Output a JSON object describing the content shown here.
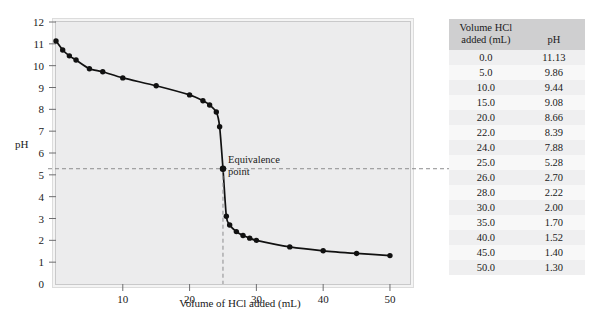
{
  "chart_data": {
    "type": "line",
    "title": "",
    "xlabel": "Volume of HCl added (mL)",
    "ylabel": "pH",
    "xlim": [
      0,
      53
    ],
    "ylim": [
      0,
      12
    ],
    "xticks": [
      10,
      20,
      30,
      40,
      50
    ],
    "yticks": [
      0,
      1,
      2,
      3,
      4,
      5,
      6,
      7,
      8,
      9,
      10,
      11,
      12
    ],
    "grid": false,
    "legend": null,
    "x": [
      0.0,
      1.0,
      2.0,
      3.0,
      5.0,
      7.0,
      10.0,
      15.0,
      20.0,
      22.0,
      23.0,
      24.0,
      24.5,
      25.0,
      25.5,
      26.0,
      27.0,
      28.0,
      29.0,
      30.0,
      35.0,
      40.0,
      45.0,
      50.0
    ],
    "y": [
      11.13,
      10.72,
      10.45,
      10.26,
      9.86,
      9.72,
      9.44,
      9.08,
      8.66,
      8.39,
      8.2,
      7.88,
      7.2,
      5.28,
      3.1,
      2.7,
      2.4,
      2.22,
      2.1,
      2.0,
      1.7,
      1.52,
      1.4,
      1.3
    ],
    "annotations": [
      {
        "label_line1": "Equivalence",
        "label_line2": "point",
        "x": 25.0,
        "y": 5.28
      }
    ]
  },
  "chart": {
    "ylabel": "pH",
    "xlabel": "Volume of HCl added (mL)",
    "ytick_labels": [
      "12",
      "11",
      "10",
      "9",
      "8",
      "7",
      "6",
      "5",
      "4",
      "3",
      "2",
      "1",
      "0"
    ],
    "xtick_labels": [
      "10",
      "20",
      "30",
      "40",
      "50"
    ],
    "equivalence_label_line1": "Equivalence",
    "equivalence_label_line2": "point"
  },
  "table": {
    "headers": {
      "volume_line1": "Volume HCl",
      "volume_line2": "added (mL)",
      "ph": "pH"
    },
    "rows": [
      {
        "volume": "0.0",
        "ph": "11.13"
      },
      {
        "volume": "5.0",
        "ph": "9.86"
      },
      {
        "volume": "10.0",
        "ph": "9.44"
      },
      {
        "volume": "15.0",
        "ph": "9.08"
      },
      {
        "volume": "20.0",
        "ph": "8.66"
      },
      {
        "volume": "22.0",
        "ph": "8.39"
      },
      {
        "volume": "24.0",
        "ph": "7.88"
      },
      {
        "volume": "25.0",
        "ph": "5.28"
      },
      {
        "volume": "26.0",
        "ph": "2.70"
      },
      {
        "volume": "28.0",
        "ph": "2.22"
      },
      {
        "volume": "30.0",
        "ph": "2.00"
      },
      {
        "volume": "35.0",
        "ph": "1.70"
      },
      {
        "volume": "40.0",
        "ph": "1.52"
      },
      {
        "volume": "45.0",
        "ph": "1.40"
      },
      {
        "volume": "50.0",
        "ph": "1.30"
      }
    ]
  },
  "colors": {
    "curve": "#111111",
    "panel_bg": "#ececed",
    "header_bg": "#cfcfd0",
    "row_bg_odd": "#efeff0",
    "row_bg_even": "#f8f8f8",
    "dashed": "#8d8d8f"
  }
}
